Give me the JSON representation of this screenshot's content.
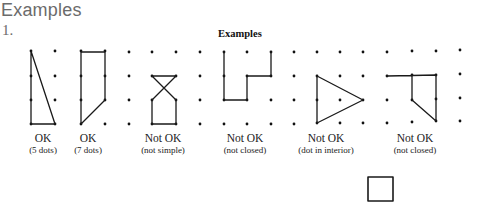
{
  "page": {
    "heading": "Examples",
    "item_number": "1."
  },
  "figure": {
    "title": "Examples",
    "examples": [
      {
        "verdict": "OK",
        "note": "(5 dots)"
      },
      {
        "verdict": "OK",
        "note": "(7 dots)"
      },
      {
        "verdict": "Not OK",
        "note": "(not simple)"
      },
      {
        "verdict": "Not OK",
        "note": "(not closed)"
      },
      {
        "verdict": "Not OK",
        "note": "(dot in interior)"
      },
      {
        "verdict": "Not OK",
        "note": "(not closed)"
      }
    ],
    "extra_shape": "square"
  }
}
